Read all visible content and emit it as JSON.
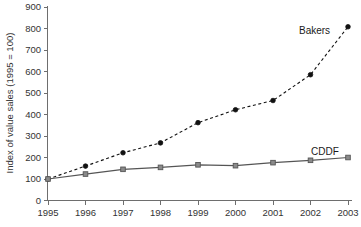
{
  "chart_data": {
    "type": "line",
    "title": "",
    "xlabel": "",
    "ylabel": "Index of value sales (1995 = 100)",
    "categories": [
      "1995",
      "1996",
      "1997",
      "1998",
      "1999",
      "2000",
      "2001",
      "2002",
      "2003"
    ],
    "x": [
      1995,
      1996,
      1997,
      1998,
      1999,
      2000,
      2001,
      2002,
      2003
    ],
    "series": [
      {
        "name": "Bakers",
        "values": [
          100,
          160,
          222,
          268,
          362,
          422,
          465,
          585,
          808
        ],
        "style": "dashed",
        "color": "#111111",
        "marker": "circle"
      },
      {
        "name": "CDDF",
        "values": [
          100,
          123,
          145,
          154,
          166,
          162,
          176,
          187,
          200
        ],
        "style": "solid",
        "color": "#555555",
        "marker": "square"
      }
    ],
    "ylim": [
      0,
      900
    ],
    "yticks": [
      0,
      100,
      200,
      300,
      400,
      500,
      600,
      700,
      800,
      900
    ],
    "ytick_labels": [
      "0",
      "100",
      "200",
      "300",
      "400",
      "500",
      "600",
      "700",
      "800",
      "900"
    ],
    "xlim": [
      1995,
      2003
    ],
    "grid": false,
    "legend_position": "inline-annotations",
    "annotations": [
      {
        "text": "Bakers",
        "near_x": 2002,
        "near_y": 760
      },
      {
        "text": "CDDF",
        "near_x": 2002.6,
        "near_y": 235
      }
    ]
  },
  "labels": {
    "y_axis_title": "Index of value sales (1995 = 100)",
    "series_bakers": "Bakers",
    "series_cddf": "CDDF"
  }
}
